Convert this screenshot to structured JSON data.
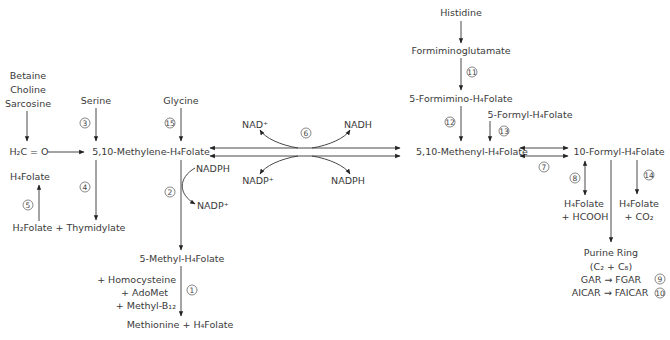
{
  "diagram": {
    "nodes": {
      "betaine": "Betaine",
      "choline": "Choline",
      "sarcosine": "Sarcosine",
      "serine": "Serine",
      "glycine": "Glycine",
      "formaldehyde": "H₂C = O",
      "methylene_thf": "5,10-Methylene-H₄Folate",
      "h4folate_left": "H₄Folate",
      "h2folate_thymidylate": "H₂Folate + Thymidylate",
      "nadph_2": "NADPH",
      "nadp_2": "NADP⁺",
      "methyl_thf": "5-Methyl-H₄Folate",
      "homocysteine": "+ Homocysteine",
      "adomet": "+ AdoMet",
      "methyl_b12": "+ Methyl-B₁₂",
      "methionine": "Methionine + H₄Folate",
      "nad_plus": "NAD⁺",
      "nadh": "NADH",
      "nadp_plus_6": "NADP⁺",
      "nadph_6": "NADPH",
      "histidine": "Histidine",
      "formiminoglutamate": "Formiminoglutamate",
      "formimino_thf": "5-Formimino-H₄Folate",
      "formyl5_thf": "5-Formyl-H₄Folate",
      "methenyl_thf": "5,10-Methenyl-H₄Folate",
      "formyl10_thf": "10-Formyl-H₄Folate",
      "h4folate_8": "H₄Folate",
      "hcooh": "+ HCOOH",
      "h4folate_14": "H₄Folate",
      "co2": "+ CO₂",
      "purine_ring": "Purine Ring",
      "purine_carbons": "(C₂ + C₈)",
      "gar": "GAR → FGAR",
      "aicar": "AICAR → FAICAR"
    },
    "reaction_numbers": {
      "r1": "1",
      "r2": "2",
      "r3": "3",
      "r4": "4",
      "r5": "5",
      "r6": "6",
      "r7": "7",
      "r8": "8",
      "r9": "9",
      "r10": "10",
      "r11": "11",
      "r12": "12",
      "r13": "13",
      "r14": "14",
      "r15": "15"
    },
    "colors": {
      "text": "#3a3a3a",
      "line": "#333333"
    }
  }
}
